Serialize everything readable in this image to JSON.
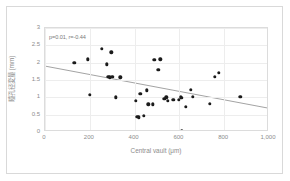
{
  "chart_data": {
    "type": "scatter",
    "title": "",
    "xlabel": "Central vault (μm)",
    "ylabel": "瞳孔径変量 (mm)",
    "xlim": [
      0,
      1000
    ],
    "ylim": [
      0,
      3
    ],
    "xticks": [
      "0",
      "200",
      "400",
      "600",
      "800",
      "1,000"
    ],
    "xtick_values": [
      0,
      200,
      400,
      600,
      800,
      1000
    ],
    "yticks": [
      "0",
      "0.5",
      "1",
      "1.5",
      "2",
      "2.5",
      "3"
    ],
    "ytick_values": [
      0,
      0.5,
      1,
      1.5,
      2,
      2.5,
      3
    ],
    "grid": true,
    "legend": "none",
    "annotation": "p=0.01, r=-0.44",
    "statistics": {
      "p_value": "0.01",
      "correlation_r": "-0.44"
    },
    "marker_color": "#1b1b1b",
    "trendline_color": "#8a8a8a",
    "gridline_color": "#ededed",
    "axis_text_color": "#8c8c8c",
    "trendline": {
      "x0": 0,
      "y0": 1.88,
      "x1": 1000,
      "y1": 0.65
    },
    "points": [
      [
        130,
        2.0
      ],
      [
        190,
        2.1
      ],
      [
        200,
        1.08
      ],
      [
        253,
        2.4
      ],
      [
        275,
        1.95
      ],
      [
        282,
        1.6
      ],
      [
        290,
        1.58
      ],
      [
        296,
        2.3
      ],
      [
        300,
        1.6
      ],
      [
        315,
        1.0
      ],
      [
        337,
        1.58
      ],
      [
        405,
        0.9
      ],
      [
        412,
        0.43
      ],
      [
        420,
        0.42
      ],
      [
        425,
        1.1
      ],
      [
        442,
        0.47
      ],
      [
        455,
        1.2
      ],
      [
        462,
        0.8
      ],
      [
        480,
        0.8
      ],
      [
        488,
        2.08
      ],
      [
        505,
        1.8
      ],
      [
        515,
        2.1
      ],
      [
        532,
        0.96
      ],
      [
        541,
        1.0
      ],
      [
        547,
        0.9
      ],
      [
        573,
        0.92
      ],
      [
        596,
        0.92
      ],
      [
        607,
        1.0
      ],
      [
        610,
        0.03
      ],
      [
        612,
        0.98
      ],
      [
        628,
        0.72
      ],
      [
        650,
        1.21
      ],
      [
        660,
        1.02
      ],
      [
        735,
        0.81
      ],
      [
        757,
        1.6
      ],
      [
        775,
        1.7
      ],
      [
        872,
        1.01
      ]
    ]
  }
}
